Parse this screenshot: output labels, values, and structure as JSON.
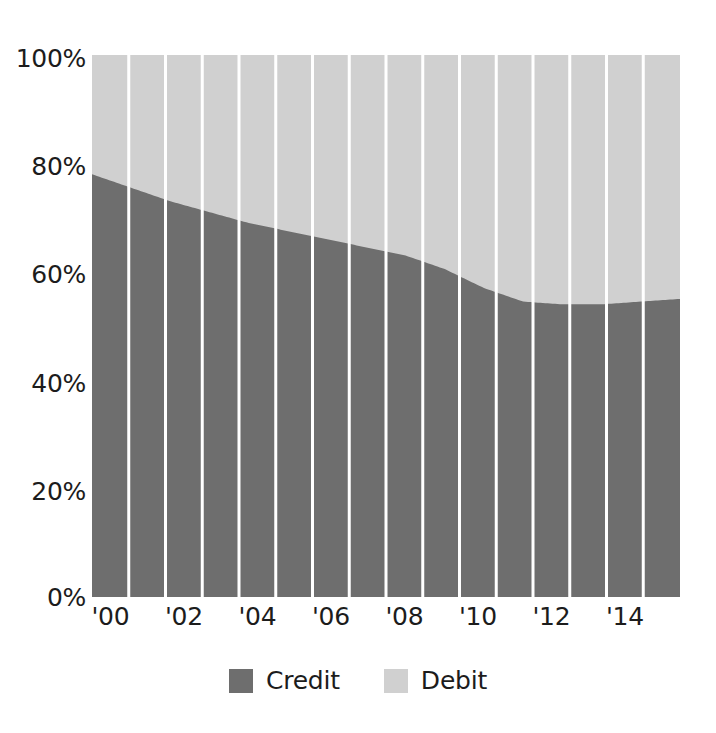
{
  "chart_data": {
    "type": "area",
    "subtype": "100% stacked column",
    "title": "",
    "subtitle": "",
    "xlabel": "",
    "ylabel": "",
    "ylim": [
      0,
      100
    ],
    "y_ticks": [
      0,
      20,
      40,
      60,
      80,
      100
    ],
    "y_tick_labels": [
      "0%",
      "20%",
      "40%",
      "60%",
      "80%",
      "100%"
    ],
    "grid": false,
    "legend_position": "bottom-center",
    "x": [
      2000,
      2001,
      2002,
      2003,
      2004,
      2005,
      2006,
      2007,
      2008,
      2009,
      2010,
      2011,
      2012,
      2013,
      2014,
      2015
    ],
    "categories": [
      "'00",
      "'01",
      "'02",
      "'03",
      "'04",
      "'05",
      "'06",
      "'07",
      "'08",
      "'09",
      "'10",
      "'11",
      "'12",
      "'13",
      "'14",
      "'15"
    ],
    "x_tick_labels": [
      "'00",
      "'02",
      "'04",
      "'06",
      "'08",
      "'10",
      "'12",
      "'14"
    ],
    "x_tick_values": [
      2000,
      2002,
      2004,
      2006,
      2008,
      2010,
      2012,
      2014
    ],
    "series": [
      {
        "name": "Credit",
        "color": "#6e6e6e",
        "values": [
          78.0,
          75.5,
          73.0,
          71.0,
          69.0,
          67.5,
          66.0,
          64.5,
          63.0,
          60.5,
          57.0,
          54.5,
          54.0,
          54.0,
          54.5,
          55.0
        ]
      },
      {
        "name": "Debit",
        "color": "#d0d0d0",
        "values": [
          22.0,
          24.5,
          27.0,
          29.0,
          31.0,
          32.5,
          34.0,
          35.5,
          37.0,
          39.5,
          43.0,
          45.5,
          46.0,
          46.0,
          45.5,
          45.0
        ]
      }
    ]
  },
  "legend": {
    "items": [
      {
        "label": "Credit",
        "color": "#6e6e6e",
        "swatch_name": "credit-swatch"
      },
      {
        "label": "Debit",
        "color": "#d0d0d0",
        "swatch_name": "debit-swatch"
      }
    ]
  },
  "colors": {
    "credit": "#6e6e6e",
    "debit": "#d0d0d0",
    "separator": "#ffffff",
    "text": "#1c1c1c",
    "background": "#ffffff"
  },
  "axis": {
    "y_labels": [
      "100%",
      "80%",
      "60%",
      "40%",
      "20%",
      "0%"
    ],
    "x_labels": [
      "'00",
      "'02",
      "'04",
      "'06",
      "'08",
      "'10",
      "'12",
      "'14"
    ]
  }
}
